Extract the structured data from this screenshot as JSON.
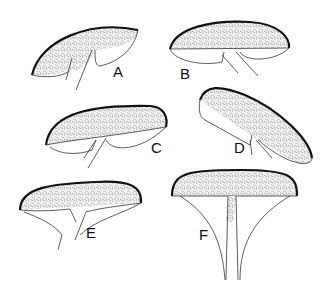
{
  "figure": {
    "background": "#ffffff",
    "ink_color": "#111111",
    "stipple_color": "#8a8a8a",
    "panels": [
      {
        "id": "A",
        "label": "A"
      },
      {
        "id": "B",
        "label": "B"
      },
      {
        "id": "C",
        "label": "C"
      },
      {
        "id": "D",
        "label": "D"
      },
      {
        "id": "E",
        "label": "E"
      },
      {
        "id": "F",
        "label": "F"
      }
    ]
  }
}
